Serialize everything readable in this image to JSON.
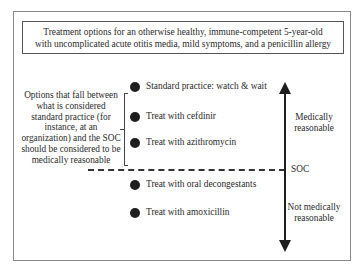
{
  "title": {
    "lines": [
      "Treatment options for an otherwise healthy, immune-competent 5-year-old",
      "with uncomplicated acute otitis media, mild symptoms, and a penicillin allergy"
    ]
  },
  "left_note": {
    "lines": [
      "Options that fall between",
      "what is considered",
      "standard practice (for",
      "instance, at an",
      "organization) and the SOC",
      "should be considered to be",
      "medically reasonable"
    ]
  },
  "options": [
    {
      "label": "Standard practice: watch & wait",
      "zone": "medically reasonable"
    },
    {
      "label": "Treat with cefdinir",
      "zone": "medically reasonable"
    },
    {
      "label": "Treat with azithromycin",
      "zone": "medically reasonable"
    },
    {
      "label": "Treat with oral decongestants",
      "zone": "not medically reasonable"
    },
    {
      "label": "Treat with amoxicillin",
      "zone": "not medically reasonable"
    }
  ],
  "axis": {
    "upper_label": [
      "Medically",
      "reasonable"
    ],
    "threshold_label": "SOC",
    "lower_label": [
      "Not medically",
      "reasonable"
    ]
  },
  "colors": {
    "line": "#1e1e1e",
    "frame": "#8a8a8a",
    "text": "#2b2b2b"
  }
}
